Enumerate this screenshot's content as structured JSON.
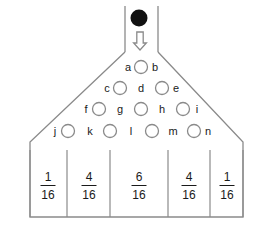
{
  "figure": {
    "kind": "galton-board",
    "background_color": "#ffffff",
    "line_color": "#8a8a8a",
    "text_color": "#1a1a1a",
    "ball_color": "#111111"
  },
  "ball": {
    "name": "falling-ball",
    "cx": 139,
    "cy": 18,
    "r": 8.5
  },
  "arrow": {
    "name": "down-arrow",
    "cx": 140,
    "top": 32,
    "bottom": 50
  },
  "chute": {
    "left_x": 125,
    "right_x": 158,
    "top_y": 6,
    "bottom_y": 52
  },
  "outline": {
    "apex_left_x": 125,
    "apex_right_x": 158,
    "apex_y": 52,
    "left_x": 30,
    "right_x": 243,
    "shoulder_y": 142,
    "bottom_y": 217
  },
  "peg_rows": [
    {
      "row": 1,
      "y": 67,
      "pegs": [
        {
          "label_left": "a",
          "label_right": "b",
          "cx": 141,
          "cy": 67,
          "r": 6.5
        }
      ]
    },
    {
      "row": 2,
      "y": 88,
      "pegs": [
        {
          "label_left": "c",
          "label_right": "d",
          "cx": 120,
          "cy": 88,
          "r": 6.5
        },
        {
          "label_left": "d",
          "label_right": "e",
          "cx": 162,
          "cy": 88,
          "r": 6.5
        }
      ]
    },
    {
      "row": 3,
      "y": 109,
      "pegs": [
        {
          "label_left": "f",
          "label_right": "g",
          "cx": 99,
          "cy": 109,
          "r": 6.5
        },
        {
          "label_left": "g",
          "label_right": "h",
          "cx": 141,
          "cy": 109,
          "r": 6.5
        },
        {
          "label_left": "h",
          "label_right": "i",
          "cx": 183,
          "cy": 109,
          "r": 6.5
        }
      ]
    },
    {
      "row": 4,
      "y": 131,
      "pegs": [
        {
          "label_left": "j",
          "label_right": "k",
          "cx": 68,
          "cy": 131,
          "r": 6.5
        },
        {
          "label_left": "k",
          "label_right": "l",
          "cx": 110,
          "cy": 131,
          "r": 6.5
        },
        {
          "label_left": "l",
          "label_right": "m",
          "cx": 152,
          "cy": 131,
          "r": 6.5
        },
        {
          "label_left": "m",
          "label_right": "n",
          "cx": 194,
          "cy": 131,
          "r": 6.5
        }
      ]
    }
  ],
  "path_labels": [
    {
      "id": "a",
      "text": "a",
      "x": 128,
      "y": 67
    },
    {
      "id": "b",
      "text": "b",
      "x": 155,
      "y": 67
    },
    {
      "id": "c",
      "text": "c",
      "x": 107,
      "y": 88
    },
    {
      "id": "d",
      "text": "d",
      "x": 141,
      "y": 88
    },
    {
      "id": "e",
      "text": "e",
      "x": 176,
      "y": 88
    },
    {
      "id": "f",
      "text": "f",
      "x": 86,
      "y": 109
    },
    {
      "id": "g",
      "text": "g",
      "x": 120,
      "y": 109
    },
    {
      "id": "h",
      "text": "h",
      "x": 162,
      "y": 109
    },
    {
      "id": "i",
      "text": "i",
      "x": 197,
      "y": 109
    },
    {
      "id": "j",
      "text": "j",
      "x": 55,
      "y": 131
    },
    {
      "id": "k",
      "text": "k",
      "x": 90,
      "y": 131
    },
    {
      "id": "l",
      "text": "l",
      "x": 131,
      "y": 131
    },
    {
      "id": "m",
      "text": "m",
      "x": 173,
      "y": 131
    },
    {
      "id": "n",
      "text": "n",
      "x": 208,
      "y": 131
    }
  ],
  "bins": {
    "top_y": 150,
    "bottom_y": 217,
    "fraction_center_y": 186,
    "dividers_x": [
      30,
      67,
      110,
      168,
      210,
      243
    ],
    "cells": [
      {
        "index": 0,
        "numerator": "1",
        "denominator": "16",
        "center_x": 48
      },
      {
        "index": 1,
        "numerator": "4",
        "denominator": "16",
        "center_x": 89
      },
      {
        "index": 2,
        "numerator": "6",
        "denominator": "16",
        "center_x": 139
      },
      {
        "index": 3,
        "numerator": "4",
        "denominator": "16",
        "center_x": 189
      },
      {
        "index": 4,
        "numerator": "1",
        "denominator": "16",
        "center_x": 227
      }
    ]
  },
  "chart_data": {
    "type": "bar",
    "categories": [
      "bin 1",
      "bin 2",
      "bin 3",
      "bin 4",
      "bin 5"
    ],
    "values": [
      0.0625,
      0.25,
      0.375,
      0.25,
      0.0625
    ],
    "value_labels": [
      "1/16",
      "4/16",
      "6/16",
      "4/16",
      "1/16"
    ],
    "numerators": [
      1,
      4,
      6,
      4,
      1
    ],
    "denominators": [
      16,
      16,
      16,
      16,
      16
    ],
    "xlabel": "",
    "ylabel": "",
    "ylim": [
      0,
      1
    ],
    "grid": false,
    "legend": "none",
    "peg_labels": [
      "a",
      "b",
      "c",
      "d",
      "e",
      "f",
      "g",
      "h",
      "i",
      "j",
      "k",
      "l",
      "m",
      "n"
    ],
    "peg_rows_counts": [
      1,
      2,
      3,
      4
    ]
  }
}
